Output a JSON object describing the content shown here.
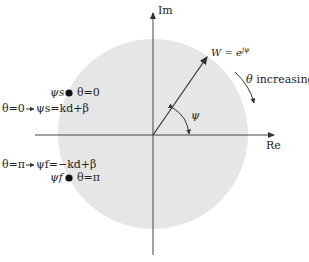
{
  "diagram": {
    "type": "complex-plane phasor diagram",
    "colors": {
      "background": "#ffffff",
      "circle_fill": "#e6e6e6",
      "lines": "#333333",
      "dots": "#111111"
    },
    "axes": {
      "imaginary_label": "Im",
      "real_label": "Re"
    },
    "vector": {
      "label_prefix": "W = e",
      "label_exponent": "jψ",
      "angle_label": "ψ"
    },
    "rotation": {
      "symbol": "θ",
      "text": "increasing"
    },
    "points": [
      {
        "dot_label": "ψs",
        "condition": "θ=0",
        "equation_left": "θ=0",
        "equation_right": "ψs=kd+β"
      },
      {
        "dot_label": "ψf",
        "condition": "θ=π",
        "equation_left": "θ=π",
        "equation_right": "ψf=−kd+β"
      }
    ]
  }
}
